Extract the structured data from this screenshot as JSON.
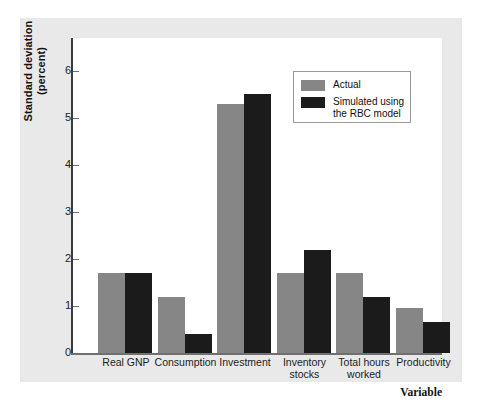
{
  "chart_data": {
    "type": "bar",
    "title": "",
    "subtitle": "",
    "xlabel": "Variable",
    "ylabel": "Standard deviation\n(percent)",
    "ylabel_line1": "Standard deviation",
    "ylabel_line2": "(percent)",
    "categories": [
      "Real GNP",
      "Consumption",
      "Investment",
      "Inventory\nstocks",
      "Total hours\nworked",
      "Productivity"
    ],
    "series": [
      {
        "name": "Actual",
        "color": "#868686",
        "values": [
          1.7,
          1.2,
          5.3,
          1.7,
          1.7,
          0.95
        ]
      },
      {
        "name": "Simulated using\nthe RBC model",
        "color": "#1b1b1b",
        "values": [
          1.7,
          0.4,
          5.5,
          2.2,
          1.2,
          0.65
        ]
      }
    ],
    "ylim": [
      0,
      6.7
    ],
    "yticks": [
      0,
      1,
      2,
      3,
      4,
      5,
      6
    ],
    "ytick_labels": [
      "0",
      "1",
      "2",
      "3",
      "4",
      "5",
      "6"
    ],
    "grid": false,
    "legend_position": "upper right",
    "legend_entries": [
      {
        "label": "Actual",
        "color": "#868686"
      },
      {
        "label": "Simulated using\nthe RBC model",
        "color": "#1b1b1b"
      }
    ],
    "background_color": "#e9e9e9",
    "plot_background_color": "#ffffff"
  }
}
